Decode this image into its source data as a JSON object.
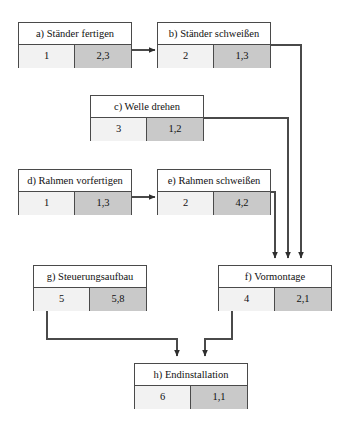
{
  "diagram": {
    "type": "activity-network-diagram",
    "stroke_color": "#4a4a4a",
    "cell_left_color": "#f2f2f2",
    "cell_right_color": "#c9c9c9",
    "background_color": "#ffffff",
    "nodes": [
      {
        "id": "a",
        "title": "a) Ständer fertigen",
        "left_value": "1",
        "right_value": "2,3",
        "x": 18,
        "y": 22,
        "w": 114,
        "h": 46
      },
      {
        "id": "b",
        "title": "b) Ständer schweißen",
        "left_value": "2",
        "right_value": "1,3",
        "x": 157,
        "y": 22,
        "w": 114,
        "h": 46
      },
      {
        "id": "c",
        "title": "c) Welle drehen",
        "left_value": "3",
        "right_value": "1,2",
        "x": 90,
        "y": 95,
        "w": 114,
        "h": 46
      },
      {
        "id": "d",
        "title": "d) Rahmen vorfertigen",
        "left_value": "1",
        "right_value": "1,3",
        "x": 18,
        "y": 169,
        "w": 114,
        "h": 46
      },
      {
        "id": "e",
        "title": "e) Rahmen schweißen",
        "left_value": "2",
        "right_value": "4,2",
        "x": 157,
        "y": 169,
        "w": 114,
        "h": 46
      },
      {
        "id": "g",
        "title": "g) Steuerungsaufbau",
        "left_value": "5",
        "right_value": "5,8",
        "x": 33,
        "y": 265,
        "w": 114,
        "h": 46
      },
      {
        "id": "f",
        "title": "f) Vormontage",
        "left_value": "4",
        "right_value": "2,1",
        "x": 218,
        "y": 265,
        "w": 114,
        "h": 46
      },
      {
        "id": "h",
        "title": "h) Endinstallation",
        "left_value": "6",
        "right_value": "1,1",
        "x": 134,
        "y": 363,
        "w": 114,
        "h": 46
      }
    ],
    "edges": [
      {
        "id": "a-to-b",
        "from": "a",
        "to": "b",
        "path": "M 132 50 L 155 50"
      },
      {
        "id": "b-to-f",
        "from": "b",
        "to": "f",
        "path": "M 271 45 L 301 45 L 301 258"
      },
      {
        "id": "c-to-f",
        "from": "c",
        "to": "f",
        "path": "M 204 118 L 288 118 L 288 258"
      },
      {
        "id": "d-to-e",
        "from": "d",
        "to": "e",
        "path": "M 132 197 L 155 197"
      },
      {
        "id": "e-to-f",
        "from": "e",
        "to": "f",
        "path": "M 271 192 L 275 192 L 275 258"
      },
      {
        "id": "g-to-h",
        "from": "g",
        "to": "h",
        "path": "M 47 311 L 47 339 L 177 339 L 177 356"
      },
      {
        "id": "f-to-h",
        "from": "f",
        "to": "h",
        "path": "M 232 311 L 232 339 L 205 339 L 205 356"
      }
    ]
  }
}
